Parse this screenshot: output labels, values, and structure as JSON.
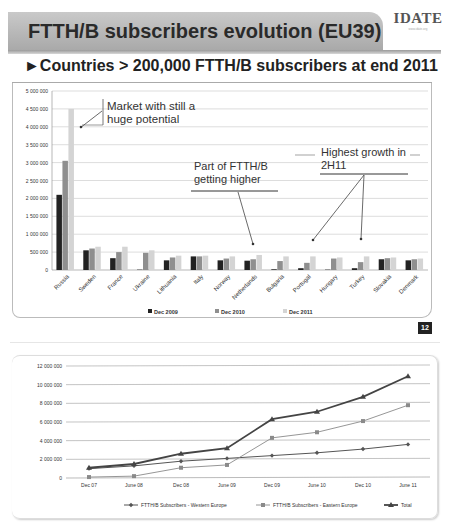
{
  "header": {
    "title": "FTTH/B subscribers evolution (EU39)",
    "logo": "IDATE",
    "logo_sub": "www.idate.org",
    "subtitle": "►Countries > 200,000 FTTH/B subscribers at end 2011",
    "page_number": "12"
  },
  "annotations": {
    "market_line1": "Market with still a",
    "market_line2": "huge potential",
    "part_line1": "Part of FTTH/B",
    "part_line2": "getting higher",
    "growth_line1": "Highest growth in",
    "growth_line2": "2H11"
  },
  "colors": {
    "dec2009": "#222222",
    "dec2010": "#8f8f8f",
    "dec2011": "#d4d4d4",
    "western": "#555555",
    "eastern": "#8a8a8a",
    "total": "#444444"
  },
  "chart_data": [
    {
      "type": "bar",
      "title": "Countries > 200,000 FTTH/B subscribers at end 2011",
      "xlabel": "",
      "ylabel": "",
      "ylim": [
        0,
        5000000
      ],
      "yticks": [
        "0",
        "500 000",
        "1 000 000",
        "1 500 000",
        "2 000 000",
        "2 500 000",
        "3 000 000",
        "3 500 000",
        "4 000 000",
        "4 500 000",
        "5 000 000"
      ],
      "grid": true,
      "legend_position": "bottom",
      "categories": [
        "Russia",
        "Sweden",
        "France",
        "Ukraine",
        "Lithuania",
        "Italy",
        "Norway",
        "Netherlands",
        "Bulgaria",
        "Portugal",
        "Hungary",
        "Turkey",
        "Slovakia",
        "Denmark"
      ],
      "series": [
        {
          "name": "Dec 2009",
          "values": [
            2100000,
            550000,
            330000,
            10000,
            270000,
            380000,
            270000,
            260000,
            20000,
            50000,
            10000,
            50000,
            300000,
            270000
          ]
        },
        {
          "name": "Dec 2010",
          "values": [
            3050000,
            600000,
            500000,
            480000,
            350000,
            380000,
            320000,
            300000,
            250000,
            200000,
            320000,
            220000,
            330000,
            300000
          ]
        },
        {
          "name": "Dec 2011",
          "values": [
            4500000,
            650000,
            650000,
            550000,
            400000,
            400000,
            380000,
            420000,
            380000,
            380000,
            350000,
            380000,
            350000,
            320000
          ]
        }
      ]
    },
    {
      "type": "line",
      "title": "",
      "xlabel": "",
      "ylabel": "",
      "ylim": [
        0,
        12000000
      ],
      "yticks": [
        "0",
        "2 000 000",
        "4 000 000",
        "6 000 000",
        "8 000 000",
        "10 000 000",
        "12 000 000"
      ],
      "grid": true,
      "legend_position": "bottom",
      "x": [
        "Dec 07",
        "June 08",
        "Dec 08",
        "June 09",
        "Dec 09",
        "June 10",
        "Dec 10",
        "June 11"
      ],
      "series": [
        {
          "name": "FTTH/B Subscribers - Western Europe",
          "marker": "diamond",
          "values": [
            1000000,
            1300000,
            1800000,
            2100000,
            2400000,
            2700000,
            3100000,
            3600000
          ]
        },
        {
          "name": "FTTH/B Subscribers - Eastern Europe",
          "marker": "square",
          "values": [
            100000,
            200000,
            1100000,
            1400000,
            4300000,
            4900000,
            6100000,
            7800000
          ]
        },
        {
          "name": "Total",
          "marker": "triangle",
          "values": [
            1100000,
            1500000,
            2600000,
            3200000,
            6300000,
            7100000,
            8700000,
            10900000
          ]
        }
      ]
    }
  ]
}
